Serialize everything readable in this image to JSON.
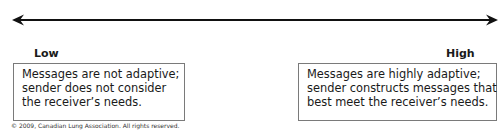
{
  "diagram": {
    "arrow": {
      "direction": "bidirectional",
      "color": "#111111"
    },
    "low": {
      "label": "Low",
      "lines": [
        "Messages are not adaptive;",
        "sender does not consider",
        "the receiver’s needs."
      ]
    },
    "high": {
      "label": "High",
      "lines": [
        "Messages are highly adaptive;",
        "sender constructs messages that",
        "best meet the receiver’s needs."
      ]
    },
    "copyright": "© 2009, Canadian Lung Association. All rights reserved."
  }
}
